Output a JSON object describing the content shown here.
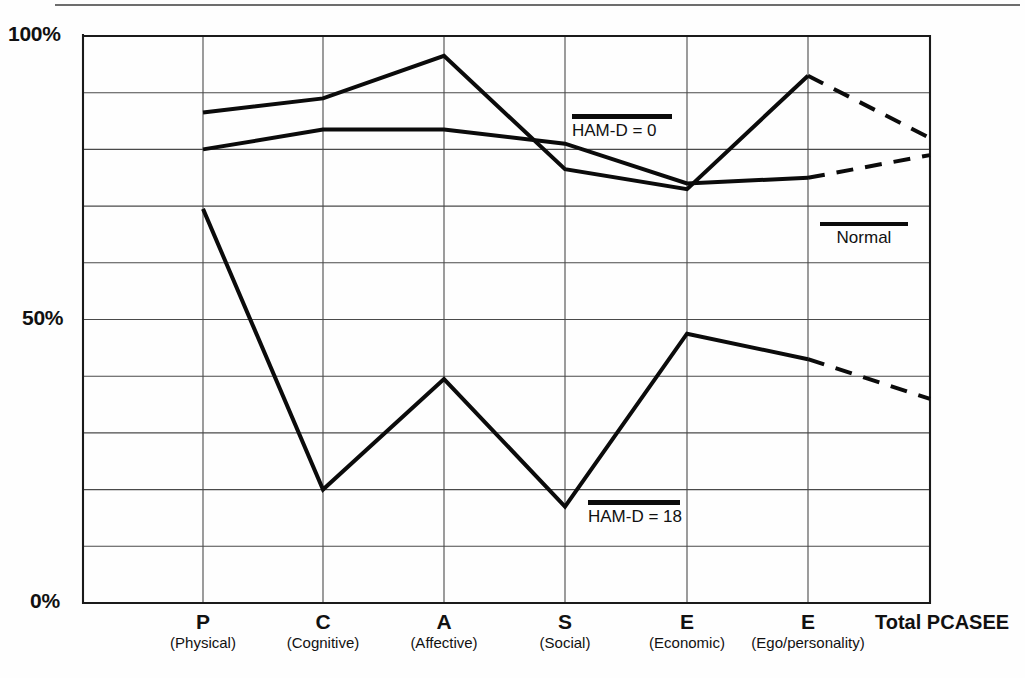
{
  "chart_data": {
    "type": "line",
    "title": "",
    "xlabel": "",
    "ylabel": "",
    "ylim": [
      0,
      100
    ],
    "ytick_labels": [
      "100%",
      "50%",
      "0%"
    ],
    "ytick_values": [
      100,
      50,
      0
    ],
    "grid": true,
    "grid_y_step": 10,
    "legend_position": "inside-plot",
    "categories": [
      "P",
      "C",
      "A",
      "S",
      "E",
      "E",
      "Total PCASEE"
    ],
    "category_sublabels": [
      "(Physical)",
      "(Cognitive)",
      "(Affective)",
      "(Social)",
      "(Economic)",
      "(Ego/personality)",
      ""
    ],
    "dashed_from_index": 5,
    "series": [
      {
        "name": "Normal",
        "values": [
          86.5,
          89.0,
          96.5,
          76.5,
          73.0,
          93.0,
          82.0
        ],
        "style": "solid-then-dashed",
        "color": "#0b0b0b",
        "width": 4
      },
      {
        "name": "HAM-D = 0",
        "values": [
          80.0,
          83.5,
          83.5,
          81.0,
          74.0,
          75.0,
          79.0
        ],
        "style": "solid-then-dashed",
        "color": "#0b0b0b",
        "width": 4
      },
      {
        "name": "HAM-D = 18",
        "values": [
          69.5,
          20.0,
          39.5,
          17.0,
          47.5,
          43.0,
          36.0
        ],
        "style": "solid-then-dashed",
        "color": "#0b0b0b",
        "width": 4
      }
    ]
  },
  "axis": {
    "y_top_label": "100%",
    "y_mid_label": "50%",
    "y_bottom_label": "0%"
  },
  "xaxis": {
    "ticks": [
      {
        "letter": "P",
        "paren": "(Physical)"
      },
      {
        "letter": "C",
        "paren": "(Cognitive)"
      },
      {
        "letter": "A",
        "paren": "(Affective)"
      },
      {
        "letter": "S",
        "paren": "(Social)"
      },
      {
        "letter": "E",
        "paren": "(Economic)"
      },
      {
        "letter": "E",
        "paren": "(Ego/personality)"
      }
    ],
    "total_label": "Total PCASEE"
  },
  "legends": [
    {
      "label": "HAM-D = 0"
    },
    {
      "label": "Normal"
    },
    {
      "label": "HAM-D = 18"
    }
  ],
  "colors": {
    "line": "#0b0b0b",
    "grid": "#4a4a4a",
    "axis": "#1a1a1a",
    "background": "#fefefe"
  }
}
